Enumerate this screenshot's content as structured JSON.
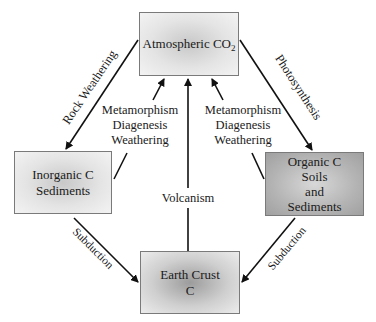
{
  "diagram": {
    "nodes": {
      "atmosphere": {
        "label": "Atmospheric CO",
        "subscript": "2"
      },
      "inorganic": {
        "line1": "Inorganic C",
        "line2": "Sediments"
      },
      "organic": {
        "line1": "Organic C",
        "line2": "Soils",
        "line3": "and",
        "line4": "Sediments"
      },
      "crust": {
        "line1": "Earth Crust",
        "line2": "C"
      }
    },
    "edges": {
      "rock_weathering": "Rock Weathering",
      "photosynthesis": "Photosynthesis",
      "left_processes": {
        "line1": "Metamorphism",
        "line2": "Diagenesis",
        "line3": "Weathering"
      },
      "right_processes": {
        "line1": "Metamorphism",
        "line2": "Diagenesis",
        "line3": "Weathering"
      },
      "volcanism": "Volcanism",
      "subduction_left": "Subduction",
      "subduction_right": "Subduction"
    }
  }
}
